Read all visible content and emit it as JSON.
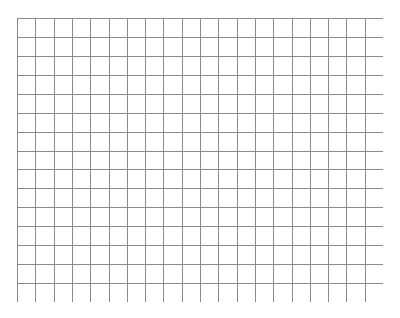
{
  "grid": {
    "columns": 20,
    "rows": 15,
    "left": 17,
    "top": 18,
    "width": 366,
    "height": 284,
    "line_color": "#8a8a8a",
    "background": "#ffffff"
  }
}
